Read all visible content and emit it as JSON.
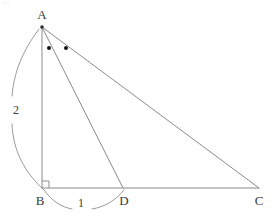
{
  "figure": {
    "kind": "geometry-diagram",
    "background_color": "#ffffff",
    "line_color": "#8a8a8a",
    "label_color": "#3a3a3a",
    "dot_color": "#111111"
  },
  "points": [
    {
      "id": "A",
      "label": "A",
      "x": 42,
      "y": 27,
      "label_x": 42,
      "label_y": 14,
      "has_vertex_dot": true
    },
    {
      "id": "B",
      "label": "B",
      "x": 42,
      "y": 188,
      "label_x": 40,
      "label_y": 200,
      "has_vertex_dot": false
    },
    {
      "id": "D",
      "label": "D",
      "x": 123,
      "y": 188,
      "label_x": 124,
      "label_y": 200,
      "has_vertex_dot": false
    },
    {
      "id": "C",
      "label": "C",
      "x": 259,
      "y": 188,
      "label_x": 259,
      "label_y": 200,
      "has_vertex_dot": false
    }
  ],
  "segments": [
    {
      "id": "AB",
      "from": "A",
      "to": "B",
      "name": "altitude-ab"
    },
    {
      "id": "AD",
      "from": "A",
      "to": "D",
      "name": "cevian-ad"
    },
    {
      "id": "AC",
      "from": "A",
      "to": "C",
      "name": "hypotenuse-ac"
    },
    {
      "id": "BC",
      "from": "B",
      "to": "C",
      "name": "base-bc"
    }
  ],
  "right_angle": {
    "at": "B",
    "size": 7,
    "label": "right-angle-at-B"
  },
  "angle_marks": [
    {
      "id": "angle-dot-bad",
      "x": 49,
      "y": 48,
      "r": 2,
      "marks": "angle BAD"
    },
    {
      "id": "angle-dot-dac",
      "x": 66,
      "y": 48,
      "r": 2,
      "marks": "angle DAC"
    }
  ],
  "measurements": [
    {
      "id": "measure-ab",
      "value": "2",
      "spans": "A to B",
      "label_x": 16,
      "label_y": 110,
      "arc_upper": "M 39 29 C 22 52 14 72 12 96",
      "arc_lower": "M 12 124 C 13 150 24 172 44 190"
    },
    {
      "id": "measure-bd",
      "value": "1",
      "spans": "B to D",
      "label_x": 81,
      "label_y": 203,
      "arc_left": "M 44 190 C 52 201 61 207 72 209",
      "arc_right": "M 92 209 C 105 207 116 200 124 190"
    }
  ]
}
